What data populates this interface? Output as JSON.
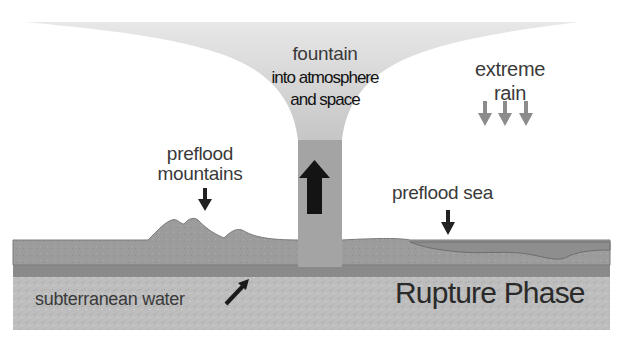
{
  "diagram": {
    "title": "Rupture Phase",
    "labels": {
      "fountain_line1": "fountain",
      "fountain_line2": "into atmosphere",
      "fountain_line3": "and space",
      "rain_line1": "extreme",
      "rain_line2": "rain",
      "mountains_line1": "preflood",
      "mountains_line2": "mountains",
      "sea": "preflood sea",
      "water": "subterranean water",
      "phase": "Rupture Phase"
    },
    "colors": {
      "crust": "#9a9a9a",
      "bedrock": "#bdbdbd",
      "water_layer": "#8a8a8a",
      "fountain": "#a8a8a8",
      "sea": "#8e8e8e",
      "arrow_dark": "#1a1a1a",
      "arrow_rain": "#8c8c8c"
    }
  }
}
